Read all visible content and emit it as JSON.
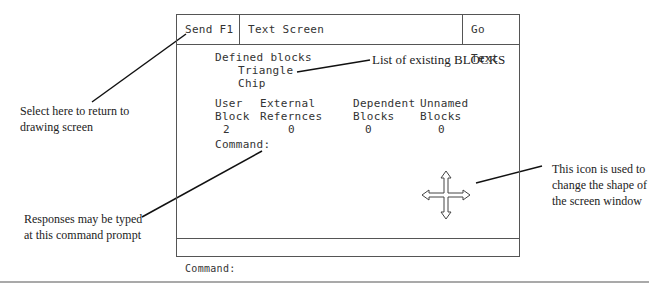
{
  "window": {
    "title_bar": {
      "send_button": "Send F1",
      "title": "Text Screen",
      "go_text_button": "Go Text"
    },
    "defined_blocks": {
      "heading": "Defined blocks",
      "items": [
        "Triangle",
        "Chip"
      ]
    },
    "summary_table": {
      "columns": [
        {
          "line1": "User",
          "line2": "Block",
          "value": "2"
        },
        {
          "line1": "External",
          "line2": "Refernces",
          "value": "0"
        },
        {
          "line1": "Dependent",
          "line2": "Blocks",
          "value": "0"
        },
        {
          "line1": "Unnamed",
          "line2": "Blocks",
          "value": "0"
        }
      ]
    },
    "inner_prompt": "Command:",
    "resize_icon": "four-way-arrow-icon"
  },
  "bottom_prompt": "Command:",
  "annotations": {
    "select_here": "Select here to return to drawing screen",
    "list_blocks": "List of existing BLOCKS",
    "responses": "Responses may be typed at this command prompt",
    "icon_note": "This icon is used to change the shape of the screen window"
  }
}
